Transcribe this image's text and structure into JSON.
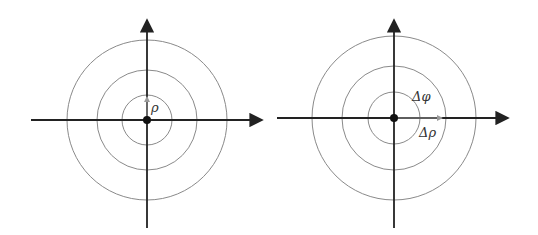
{
  "diagrams": [
    {
      "name": "polar-grid-rho",
      "center": [
        147,
        120
      ],
      "radii": [
        25,
        50,
        80
      ],
      "x_axis": [
        31,
        263
      ],
      "y_axis": [
        18,
        228
      ],
      "labels": {
        "rho": "ρ"
      }
    },
    {
      "name": "polar-grid-delta",
      "center": [
        394,
        118
      ],
      "radii": [
        26,
        52,
        82
      ],
      "x_axis": [
        277,
        509
      ],
      "y_axis": [
        18,
        228
      ],
      "labels": {
        "delta_phi": "Δφ",
        "delta_rho": "Δρ"
      }
    }
  ],
  "colors": {
    "axis": "#222222",
    "ring": "#8a8a8a",
    "origin": "#111111"
  }
}
